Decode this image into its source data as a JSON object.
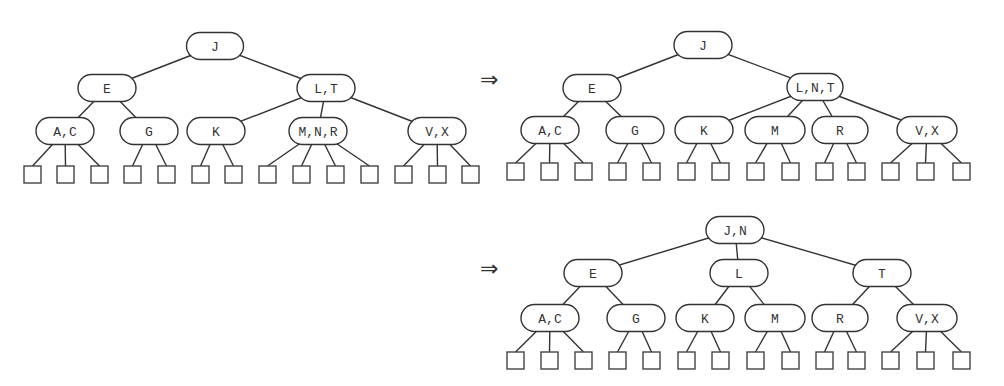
{
  "figure": {
    "arrow_symbol": "⇒",
    "trees": [
      {
        "id": "tree-before",
        "nodes": [
          {
            "id": "J",
            "label": "J",
            "cx": 215,
            "cy": 46,
            "w": 57,
            "parent": null
          },
          {
            "id": "E",
            "label": "E",
            "cx": 107,
            "cy": 88,
            "w": 58,
            "parent": "J"
          },
          {
            "id": "LT",
            "label": "L,T",
            "cx": 326,
            "cy": 88,
            "w": 58,
            "parent": "J"
          },
          {
            "id": "AC",
            "label": "A,C",
            "cx": 65,
            "cy": 131,
            "w": 58,
            "parent": "E"
          },
          {
            "id": "G",
            "label": "G",
            "cx": 149,
            "cy": 131,
            "w": 58,
            "parent": "E"
          },
          {
            "id": "K",
            "label": "K",
            "cx": 216,
            "cy": 131,
            "w": 58,
            "parent": "LT"
          },
          {
            "id": "MNR",
            "label": "M,N,R",
            "cx": 318,
            "cy": 131,
            "w": 58,
            "parent": "LT"
          },
          {
            "id": "VX",
            "label": "V,X",
            "cx": 437,
            "cy": 131,
            "w": 58,
            "parent": "LT"
          }
        ],
        "leaf_y": 166,
        "leaves": [
          {
            "x": 24,
            "parent": "AC"
          },
          {
            "x": 57,
            "parent": "AC"
          },
          {
            "x": 91,
            "parent": "AC"
          },
          {
            "x": 124,
            "parent": "G"
          },
          {
            "x": 158,
            "parent": "G"
          },
          {
            "x": 192,
            "parent": "K"
          },
          {
            "x": 225,
            "parent": "K"
          },
          {
            "x": 259,
            "parent": "MNR"
          },
          {
            "x": 293,
            "parent": "MNR"
          },
          {
            "x": 327,
            "parent": "MNR"
          },
          {
            "x": 361,
            "parent": "MNR"
          },
          {
            "x": 395,
            "parent": "VX"
          },
          {
            "x": 429,
            "parent": "VX"
          },
          {
            "x": 462,
            "parent": "VX"
          }
        ]
      },
      {
        "id": "tree-after-first-split",
        "nodes": [
          {
            "id": "J",
            "label": "J",
            "cx": 703,
            "cy": 45,
            "w": 58,
            "parent": null
          },
          {
            "id": "E",
            "label": "E",
            "cx": 592,
            "cy": 88,
            "w": 58,
            "parent": "J"
          },
          {
            "id": "LNT",
            "label": "L,N,T",
            "cx": 815,
            "cy": 87,
            "w": 56,
            "parent": "J"
          },
          {
            "id": "AC",
            "label": "A,C",
            "cx": 550,
            "cy": 130,
            "w": 58,
            "parent": "E"
          },
          {
            "id": "G",
            "label": "G",
            "cx": 635,
            "cy": 130,
            "w": 58,
            "parent": "E"
          },
          {
            "id": "K",
            "label": "K",
            "cx": 704,
            "cy": 130,
            "w": 58,
            "parent": "LNT"
          },
          {
            "id": "M",
            "label": "M",
            "cx": 775,
            "cy": 130,
            "w": 60,
            "parent": "LNT"
          },
          {
            "id": "R",
            "label": "R",
            "cx": 840,
            "cy": 130,
            "w": 56,
            "parent": "LNT"
          },
          {
            "id": "VX",
            "label": "V,X",
            "cx": 927,
            "cy": 130,
            "w": 60,
            "parent": "LNT"
          }
        ],
        "leaf_y": 163,
        "leaves": [
          {
            "x": 507,
            "parent": "AC"
          },
          {
            "x": 541,
            "parent": "AC"
          },
          {
            "x": 575,
            "parent": "AC"
          },
          {
            "x": 609,
            "parent": "G"
          },
          {
            "x": 643,
            "parent": "G"
          },
          {
            "x": 678,
            "parent": "K"
          },
          {
            "x": 712,
            "parent": "K"
          },
          {
            "x": 747,
            "parent": "M"
          },
          {
            "x": 782,
            "parent": "M"
          },
          {
            "x": 816,
            "parent": "R"
          },
          {
            "x": 848,
            "parent": "R"
          },
          {
            "x": 882,
            "parent": "VX"
          },
          {
            "x": 917,
            "parent": "VX"
          },
          {
            "x": 953,
            "parent": "VX"
          }
        ]
      },
      {
        "id": "tree-after-second-split",
        "nodes": [
          {
            "id": "JN",
            "label": "J,N",
            "cx": 735,
            "cy": 230,
            "w": 58,
            "parent": null
          },
          {
            "id": "E",
            "label": "E",
            "cx": 593,
            "cy": 273,
            "w": 58,
            "parent": "JN"
          },
          {
            "id": "L",
            "label": "L",
            "cx": 739,
            "cy": 273,
            "w": 58,
            "parent": "JN"
          },
          {
            "id": "T",
            "label": "T",
            "cx": 882,
            "cy": 273,
            "w": 58,
            "parent": "JN"
          },
          {
            "id": "AC",
            "label": "A,C",
            "cx": 550,
            "cy": 318,
            "w": 58,
            "parent": "E"
          },
          {
            "id": "G",
            "label": "G",
            "cx": 636,
            "cy": 318,
            "w": 58,
            "parent": "E"
          },
          {
            "id": "K",
            "label": "K",
            "cx": 705,
            "cy": 318,
            "w": 58,
            "parent": "L"
          },
          {
            "id": "M",
            "label": "M",
            "cx": 775,
            "cy": 318,
            "w": 60,
            "parent": "L"
          },
          {
            "id": "R",
            "label": "R",
            "cx": 840,
            "cy": 318,
            "w": 56,
            "parent": "T"
          },
          {
            "id": "VX",
            "label": "V,X",
            "cx": 927,
            "cy": 318,
            "w": 60,
            "parent": "T"
          }
        ],
        "leaf_y": 352,
        "leaves": [
          {
            "x": 507,
            "parent": "AC"
          },
          {
            "x": 541,
            "parent": "AC"
          },
          {
            "x": 575,
            "parent": "AC"
          },
          {
            "x": 609,
            "parent": "G"
          },
          {
            "x": 643,
            "parent": "G"
          },
          {
            "x": 678,
            "parent": "K"
          },
          {
            "x": 712,
            "parent": "K"
          },
          {
            "x": 747,
            "parent": "M"
          },
          {
            "x": 782,
            "parent": "M"
          },
          {
            "x": 816,
            "parent": "R"
          },
          {
            "x": 848,
            "parent": "R"
          },
          {
            "x": 882,
            "parent": "VX"
          },
          {
            "x": 917,
            "parent": "VX"
          },
          {
            "x": 953,
            "parent": "VX"
          }
        ]
      }
    ],
    "arrows": [
      {
        "x": 480,
        "y": 87
      },
      {
        "x": 480,
        "y": 276
      }
    ],
    "style": {
      "node_height": 27,
      "leaf_size": 17,
      "stroke": "#333333",
      "background": "#ffffff"
    }
  }
}
